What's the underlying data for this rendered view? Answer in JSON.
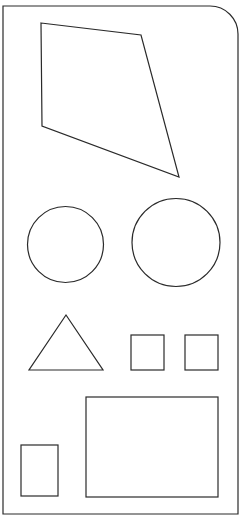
{
  "canvas": {
    "width": 243,
    "height": 518,
    "background": "#ffffff",
    "stroke": "#2a2a2a"
  },
  "shapes": {
    "frame": {
      "x": 3,
      "y": 6,
      "width": 235,
      "height": 508,
      "top_right_radius": 28
    },
    "quadrilateral": {
      "points": "41,23 141,35 179,177 42,126"
    },
    "circle_small": {
      "cx": 65.5,
      "cy": 244.5,
      "r": 38
    },
    "circle_large": {
      "cx": 176,
      "cy": 242.5,
      "r": 44
    },
    "triangle": {
      "points": "66,315 29,370 103,370"
    },
    "square_left": {
      "x": 131,
      "y": 335,
      "width": 33,
      "height": 35
    },
    "square_right": {
      "x": 185,
      "y": 335,
      "width": 33,
      "height": 35
    },
    "rect_small": {
      "x": 21,
      "y": 445,
      "width": 37,
      "height": 51
    },
    "rect_large": {
      "x": 86,
      "y": 397,
      "width": 132,
      "height": 100
    }
  }
}
